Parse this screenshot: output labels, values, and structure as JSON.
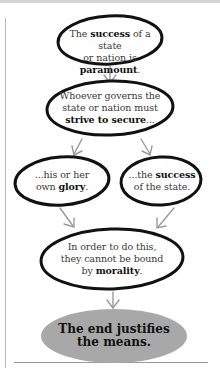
{
  "diagram": {
    "type": "flowchart",
    "colors": {
      "outline": "#111111",
      "arrow": "#9a9a9a",
      "final_fill": "#a8a8a8",
      "text": "#3a3a3a",
      "frame": "#b8b8b8"
    },
    "nodes": [
      {
        "id": "n1",
        "parts": [
          {
            "t": "The ",
            "b": false
          },
          {
            "t": "success",
            "b": true
          },
          {
            "t": " of a state",
            "b": false
          },
          {
            "t": "\nor nation is ",
            "b": false
          },
          {
            "t": "paramount",
            "b": true
          },
          {
            "t": ".",
            "b": false
          }
        ],
        "line1_a": "The ",
        "line1_b": "success",
        "line1_c": " of a state",
        "line2_a": "or nation is ",
        "line2_b": "paramount",
        "line2_c": "."
      },
      {
        "id": "n2",
        "line1": "Whoever governs the",
        "line2": "state or nation must",
        "line3_b": "strive to secure",
        "line3_c": "..."
      },
      {
        "id": "n3",
        "line1": "...his or her",
        "line2_a": "own ",
        "line2_b": "glory",
        "line2_c": "."
      },
      {
        "id": "n4",
        "line1_a": "...the ",
        "line1_b": "success",
        "line2": "of the state."
      },
      {
        "id": "n5",
        "line1": "In order to do this,",
        "line2": "they cannot be bound",
        "line3_a": "by ",
        "line3_b": "morality",
        "line3_c": "."
      },
      {
        "id": "n6",
        "line1": "The end justifies",
        "line2": "the means."
      }
    ],
    "edges": [
      {
        "from": "n1",
        "to": "n2"
      },
      {
        "from": "n2",
        "to": "n3"
      },
      {
        "from": "n2",
        "to": "n4"
      },
      {
        "from": "n3",
        "to": "n5"
      },
      {
        "from": "n4",
        "to": "n5"
      },
      {
        "from": "n5",
        "to": "n6"
      }
    ]
  }
}
